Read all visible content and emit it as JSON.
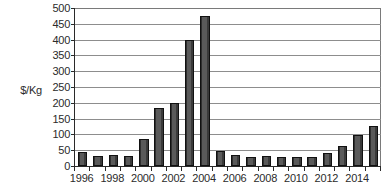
{
  "chart_data": {
    "type": "bar",
    "title": "",
    "subtitle": "",
    "xlabel": "",
    "ylabel": "$/Kg",
    "ylim": [
      0,
      500
    ],
    "ytick_step": 50,
    "yticks": [
      0,
      50,
      100,
      150,
      200,
      250,
      300,
      350,
      400,
      450,
      500
    ],
    "ytick_labels": [
      "0",
      "50",
      "100",
      "150",
      "200",
      "250",
      "300",
      "350",
      "400",
      "450",
      "500"
    ],
    "grid": true,
    "grid_axis": "y",
    "legend": false,
    "legend_position": "none",
    "xtick_labels": [
      "1996",
      "1998",
      "2000",
      "2002",
      "2004",
      "2006",
      "2008",
      "2010",
      "2012",
      "2014"
    ],
    "xtick_label_step": 2,
    "categories": [
      "1996",
      "1997",
      "1998",
      "1999",
      "2000",
      "2001",
      "2002",
      "2003",
      "2004",
      "2005",
      "2006",
      "2007",
      "2008",
      "2009",
      "2010",
      "2011",
      "2012",
      "2013",
      "2014",
      "2015"
    ],
    "values": [
      45,
      33,
      35,
      33,
      85,
      185,
      200,
      400,
      475,
      47,
      35,
      30,
      33,
      30,
      30,
      28,
      40,
      62,
      98,
      127
    ],
    "bar_color": "#4a4a4a",
    "bar_edge_color": "#111111",
    "axis_color": "#2a2a2a",
    "grid_color": "#8d8d8d",
    "background_color": "#ffffff",
    "text_color": "#2b2b2b"
  }
}
